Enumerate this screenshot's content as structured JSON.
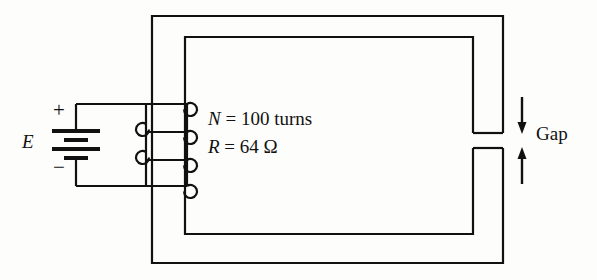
{
  "figure": {
    "background_color": "#fdfdfb",
    "line_color": "#111111",
    "line_width": 2
  },
  "source": {
    "label": "E",
    "terminal_positive": "+",
    "terminal_negative": "−",
    "symbol": "battery"
  },
  "coil": {
    "turns_label": "N",
    "turns_equals": "=",
    "turns_value": "100 turns",
    "turns_text": "N = 100 turns",
    "resistance_label": "R",
    "resistance_equals": "=",
    "resistance_value": "64 Ω",
    "resistance_text": "R = 64 Ω",
    "loop_count": 3
  },
  "gap": {
    "label": "Gap",
    "arrow_down": "↓",
    "arrow_up": "↑"
  },
  "core": {
    "outer_rect": {
      "x": 152,
      "y": 16,
      "w": 351,
      "h": 247
    },
    "inner_rect": {
      "x": 185,
      "y": 37,
      "w": 288,
      "h": 197
    },
    "gap_top_y": 133,
    "gap_bottom_y": 148
  }
}
